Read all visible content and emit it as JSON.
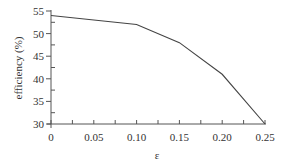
{
  "chart_data": {
    "type": "line",
    "title": "",
    "xlabel": "ε",
    "ylabel": "efficiency (%)",
    "x": [
      0,
      0.1,
      0.15,
      0.2,
      0.25
    ],
    "series": [
      {
        "name": "efficiency",
        "values": [
          54,
          52,
          48,
          41,
          30
        ]
      }
    ],
    "xlim": [
      0,
      0.25
    ],
    "ylim": [
      30,
      55
    ],
    "xticks": [
      "0",
      "0.05",
      "0.10",
      "0.15",
      "0.20",
      "0.25"
    ],
    "yticks": [
      "30",
      "35",
      "40",
      "45",
      "50",
      "55"
    ],
    "grid": false,
    "legend": null,
    "line_color": "#444444"
  }
}
